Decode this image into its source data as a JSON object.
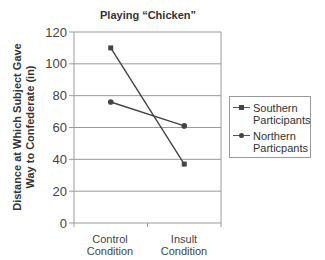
{
  "chart_data": {
    "type": "line",
    "title": "Playing “Chicken”",
    "xlabel": "",
    "ylabel": "Distance at Which Subject Gave Way to Confederate (in)",
    "ylabel_lines": [
      "Distance at Which Subject Gave",
      "Way to Confederate (in)"
    ],
    "categories": [
      "Control Condition",
      "Insult Condition"
    ],
    "category_lines": [
      [
        "Control",
        "Condition"
      ],
      [
        "Insult",
        "Condition"
      ]
    ],
    "series": [
      {
        "name": "Southern Participants",
        "name_lines": [
          "Southern",
          "Participants"
        ],
        "marker": "square",
        "values": [
          110,
          37
        ]
      },
      {
        "name": "Northern Particpants",
        "name_lines": [
          "Northern",
          "Particpants"
        ],
        "marker": "circle",
        "values": [
          76,
          61
        ]
      }
    ],
    "ylim": [
      0,
      120
    ],
    "yticks": [
      0,
      20,
      40,
      60,
      80,
      100,
      120
    ],
    "grid": true,
    "legend_position": "right"
  },
  "colors": {
    "line": "#444444",
    "grid": "#9a9a9a",
    "text": "#333333"
  }
}
